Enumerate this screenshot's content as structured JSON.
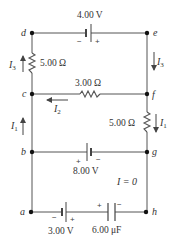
{
  "diagram": {
    "nodes": {
      "a": "a",
      "b": "b",
      "c": "c",
      "d": "d",
      "e": "e",
      "f": "f",
      "g": "g",
      "h": "h"
    },
    "components": {
      "battery_top": {
        "label": "4.00 V",
        "neg": "−",
        "pos": "+"
      },
      "resistor_dc": {
        "label": "5.00 Ω"
      },
      "resistor_cf": {
        "label": "3.00 Ω"
      },
      "resistor_fg": {
        "label": "5.00 Ω"
      },
      "battery_bg": {
        "label": "8.00 V",
        "pos": "+",
        "neg": "−"
      },
      "battery_ah": {
        "label": "3.00 V",
        "neg": "−",
        "pos": "+"
      },
      "capacitor_ah": {
        "label": "6.00 μF",
        "pos": "+",
        "neg": "−"
      }
    },
    "currents": {
      "I3_left": {
        "sym": "I",
        "sub": "3"
      },
      "I3_right": {
        "sym": "I",
        "sub": "3"
      },
      "I2": {
        "sym": "I",
        "sub": "2"
      },
      "I1_left": {
        "sym": "I",
        "sub": "1"
      },
      "I1_right": {
        "sym": "I",
        "sub": "1"
      },
      "zero": "I = 0"
    },
    "colors": {
      "wire": "#555555",
      "text": "#333333",
      "background": "#ffffff"
    }
  }
}
